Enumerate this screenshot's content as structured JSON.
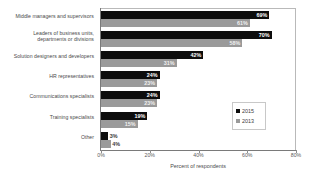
{
  "chart_data": {
    "type": "bar",
    "orientation": "horizontal",
    "title": "",
    "xlabel": "Percent of respondents",
    "ylabel": "",
    "xlim": [
      0,
      80
    ],
    "xticks": [
      "0%",
      "20%",
      "40%",
      "60%",
      "80%"
    ],
    "xtick_values": [
      0,
      20,
      40,
      60,
      80
    ],
    "grid": false,
    "legend_position": "center-right",
    "categories": [
      "Middle managers and supervisors",
      "Leaders of business units, departments or divisions",
      "Solution designers and developers",
      "HR representatives",
      "Communications specialists",
      "Training specialists",
      "Other"
    ],
    "series": [
      {
        "name": "2015",
        "color": "#0d0d0d",
        "values": [
          69,
          70,
          42,
          24,
          24,
          19,
          3
        ],
        "labels": [
          "69%",
          "70%",
          "42%",
          "24%",
          "24%",
          "19%",
          "3%"
        ]
      },
      {
        "name": "2013",
        "color": "#9a9a9a",
        "values": [
          61,
          58,
          31,
          23,
          23,
          15,
          4
        ],
        "labels": [
          "61%",
          "58%",
          "31%",
          "23%",
          "23%",
          "15%",
          "4%"
        ]
      }
    ]
  },
  "categories_display": [
    {
      "line1": "Middle managers and supervisors",
      "line2": ""
    },
    {
      "line1": "Leaders of business units,",
      "line2": "departments or divisions"
    },
    {
      "line1": "Solution designers and developers",
      "line2": ""
    },
    {
      "line1": "HR representatives",
      "line2": ""
    },
    {
      "line1": "Communications specialists",
      "line2": ""
    },
    {
      "line1": "Training specialists",
      "line2": ""
    },
    {
      "line1": "Other",
      "line2": ""
    }
  ],
  "legend": {
    "items": [
      {
        "label": "2015",
        "color": "#0d0d0d"
      },
      {
        "label": "2013",
        "color": "#9a9a9a"
      }
    ]
  },
  "axis": {
    "x_title": "Percent of respondents"
  }
}
